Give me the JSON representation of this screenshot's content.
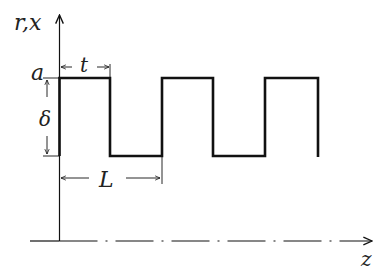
{
  "diagram": {
    "type": "square-wave profile",
    "labels": {
      "y_axis": "r,x",
      "x_axis": "z",
      "amplitude_top": "a",
      "depth": "δ",
      "width": "t",
      "period": "L"
    },
    "colors": {
      "line": "#111111",
      "background": "#ffffff"
    }
  }
}
